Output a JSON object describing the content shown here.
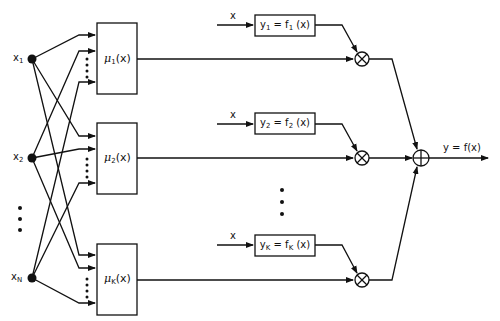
{
  "diagram": {
    "type": "fuzzy-mixture-of-experts block diagram",
    "inputs": [
      {
        "label": "x",
        "sub": "1"
      },
      {
        "label": "x",
        "sub": "2"
      },
      {
        "label": "x",
        "sub": "N"
      }
    ],
    "membership_blocks": [
      {
        "mu": "μ",
        "sub": "1",
        "arg": "(x)"
      },
      {
        "mu": "μ",
        "sub": "2",
        "arg": "(x)"
      },
      {
        "mu": "μ",
        "sub": "K",
        "arg": "(x)"
      }
    ],
    "expert_blocks": [
      {
        "input_label": "x",
        "y": "y",
        "ysub": "1",
        "f": "f",
        "fsub": "1",
        "arg": " (x)"
      },
      {
        "input_label": "x",
        "y": "y",
        "ysub": "2",
        "f": "f",
        "fsub": "2",
        "arg": " (x)"
      },
      {
        "input_label": "x",
        "y": "y",
        "ysub": "K",
        "f": "f",
        "fsub": "K",
        "arg": " (x)"
      }
    ],
    "multiplier_symbol": "⊗",
    "summation_symbol": "⊕",
    "output_label": "y = f(x)",
    "equals": " = "
  }
}
